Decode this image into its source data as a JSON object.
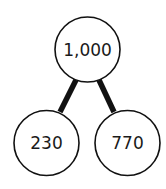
{
  "diagram": {
    "type": "number-bond",
    "whole": {
      "label": "1,000",
      "cx": 87.5,
      "cy": 49.5,
      "r": 32.5
    },
    "parts": [
      {
        "label": "230",
        "cx": 46.5,
        "cy": 143,
        "r": 32.5
      },
      {
        "label": "770",
        "cx": 127.5,
        "cy": 143,
        "r": 32.5
      }
    ],
    "colors": {
      "stroke": "#111111",
      "fill": "#ffffff",
      "text": "#1a1a1a"
    }
  }
}
